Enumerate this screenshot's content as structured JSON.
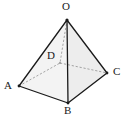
{
  "figure": {
    "name": "square-pyramid-OABCD",
    "background_color": "#ffffff",
    "edge_color": "#1a1a1a",
    "hidden_edge_color": "#8c8c8c",
    "face_fill_front_left": "#f2f2f2",
    "face_fill_front_right": "#ebebeb",
    "face_fill_base": "#e6e6e6",
    "labels": {
      "apex": "O",
      "left": "A",
      "right": "C",
      "front": "B",
      "hidden_back": "D"
    },
    "vertices": {
      "O": {
        "x": 67,
        "y": 20
      },
      "A": {
        "x": 19,
        "y": 86
      },
      "B": {
        "x": 68,
        "y": 103
      },
      "C": {
        "x": 107,
        "y": 73
      },
      "D": {
        "x": 60,
        "y": 63
      }
    },
    "label_positions": {
      "O": {
        "x": 63,
        "y": 2
      },
      "A": {
        "x": 5,
        "y": 82
      },
      "B": {
        "x": 64,
        "y": 106
      },
      "C": {
        "x": 113,
        "y": 68
      },
      "D": {
        "x": 48,
        "y": 51
      }
    },
    "edges": {
      "solid": [
        "O-A",
        "O-B",
        "O-C",
        "A-B",
        "B-C"
      ],
      "dashed": [
        "O-D",
        "A-D",
        "C-D"
      ]
    }
  }
}
